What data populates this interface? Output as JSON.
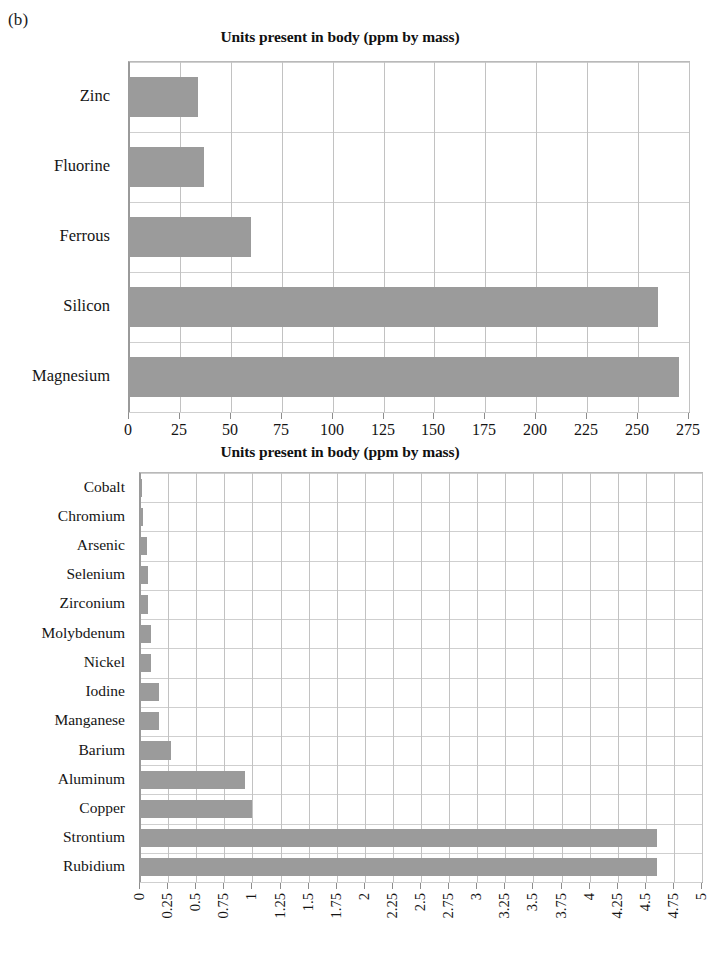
{
  "panel": {
    "label": "(b)"
  },
  "colors": {
    "bar_fill": "#9b9b9b",
    "grid": "#c2c2c2",
    "axis": "#8d8d8d",
    "text": "#141414",
    "background": "#ffffff"
  },
  "chart_data": [
    {
      "id": "chart-a",
      "type": "bar",
      "orientation": "horizontal",
      "title": "Units present in body (ppm by mass)",
      "xlabel": "",
      "ylabel": "",
      "xlim": [
        0,
        275
      ],
      "xticks": [
        0,
        25,
        50,
        75,
        100,
        125,
        150,
        175,
        200,
        225,
        250,
        275
      ],
      "xtick_labels": [
        "0",
        "25",
        "50",
        "75",
        "100",
        "125",
        "150",
        "175",
        "200",
        "225",
        "250",
        "275"
      ],
      "grid": true,
      "legend": false,
      "categories": [
        "Zinc",
        "Fluorine",
        "Ferrous",
        "Silicon",
        "Magnesium"
      ],
      "values": [
        34,
        37,
        60,
        260,
        270
      ]
    },
    {
      "id": "chart-b",
      "type": "bar",
      "orientation": "horizontal",
      "title": "Units present in body (ppm by mass)",
      "xlabel": "",
      "ylabel": "",
      "xlim": [
        0,
        5
      ],
      "xticks": [
        0,
        0.25,
        0.5,
        0.75,
        1,
        1.25,
        1.5,
        1.75,
        2,
        2.25,
        2.5,
        2.75,
        3,
        3.25,
        3.5,
        3.75,
        4,
        4.25,
        4.5,
        4.75,
        5
      ],
      "xtick_labels": [
        "0",
        "0.25",
        "0.5",
        "0.75",
        "1",
        "1.25",
        "1.5",
        "1.75",
        "2",
        "2.25",
        "2.5",
        "2.75",
        "3",
        "3.25",
        "3.5",
        "3.75",
        "4",
        "4.25",
        "4.5",
        "4.75",
        "5"
      ],
      "grid": true,
      "legend": false,
      "categories": [
        "Cobalt",
        "Chromium",
        "Arsenic",
        "Selenium",
        "Zirconium",
        "Molybdenum",
        "Nickel",
        "Iodine",
        "Manganese",
        "Barium",
        "Aluminum",
        "Copper",
        "Strontium",
        "Rubidium"
      ],
      "values": [
        0.02,
        0.03,
        0.06,
        0.07,
        0.07,
        0.1,
        0.1,
        0.17,
        0.17,
        0.28,
        0.93,
        1.0,
        4.6,
        4.6
      ]
    }
  ]
}
